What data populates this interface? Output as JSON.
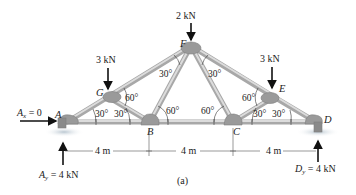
{
  "figure": {
    "caption": "(a)",
    "type": "truss free-body diagram"
  },
  "joints": {
    "A": {
      "label": "A",
      "x": 67,
      "y": 122
    },
    "B": {
      "label": "B",
      "x": 150,
      "y": 122
    },
    "C": {
      "label": "C",
      "x": 233,
      "y": 122
    },
    "D": {
      "label": "D",
      "x": 316,
      "y": 122
    },
    "E": {
      "label": "E",
      "x": 274,
      "y": 97
    },
    "F": {
      "label": "F",
      "x": 191,
      "y": 46
    },
    "G": {
      "label": "G",
      "x": 108,
      "y": 97
    }
  },
  "loads": {
    "G": "3 kN",
    "F": "2 kN",
    "E": "3 kN"
  },
  "reactions": {
    "Ax": {
      "symbol": "A",
      "sub": "x",
      "eq": " = 0"
    },
    "Ay": {
      "symbol": "A",
      "sub": "y",
      "eq": " = 4 kN"
    },
    "Dy": {
      "symbol": "D",
      "sub": "y",
      "eq": " = 4 kN"
    }
  },
  "angles": {
    "G_upper": "60°",
    "G_left": "30°",
    "G_right": "30°",
    "F_left": "30°",
    "F_right": "30°",
    "B_right": "60°",
    "C_left": "60°",
    "E_upper": "60°",
    "E_left": "30°",
    "E_right": "30°"
  },
  "dimensions": [
    "4 m",
    "4 m",
    "4 m"
  ],
  "colors": {
    "member": "#c9c9c9",
    "member_edge": "#a8a8a8",
    "gusset": "#9a9a9a",
    "ink": "#111111"
  }
}
